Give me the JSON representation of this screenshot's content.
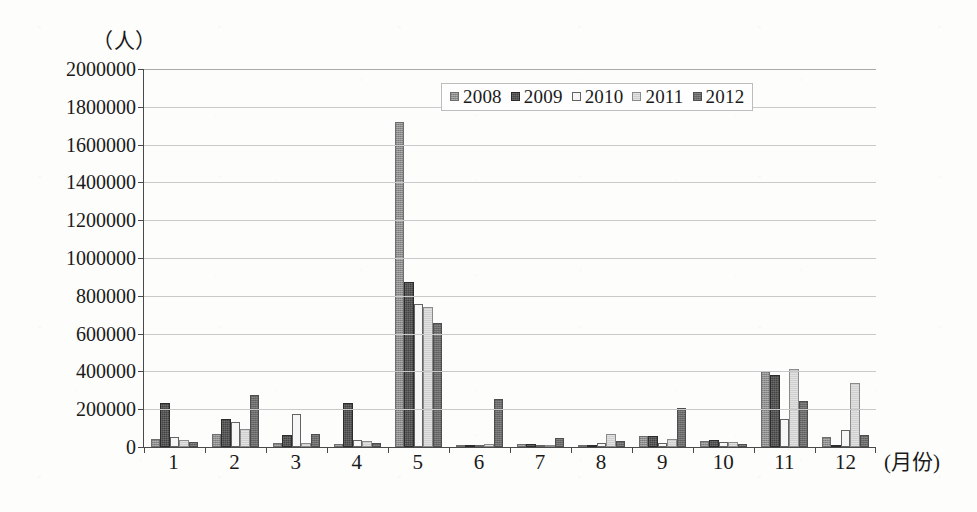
{
  "axis": {
    "unit_label": "（人）",
    "x_axis_title": "(月份)"
  },
  "legend": {
    "items": [
      {
        "label": "2008",
        "swatch": "legend-swatch-2008",
        "color": "#8d8d8d"
      },
      {
        "label": "2009",
        "swatch": "legend-swatch-2009",
        "color": "#434343"
      },
      {
        "label": "2010",
        "swatch": "legend-swatch-2010",
        "color": "#f6f6f6"
      },
      {
        "label": "2011",
        "swatch": "legend-swatch-2011",
        "color": "#cfcfcf"
      },
      {
        "label": "2012",
        "swatch": "legend-swatch-2012",
        "color": "#6a6a6a"
      }
    ]
  },
  "chart_data": {
    "type": "bar",
    "title": "",
    "subtitle": "",
    "xlabel": "(月份)",
    "ylabel": "（人）",
    "ylim": [
      0,
      2000000
    ],
    "ytick_step": 200000,
    "ytick_labels": [
      "2000000",
      "1800000",
      "1600000",
      "1400000",
      "1200000",
      "1000000",
      "800000",
      "600000",
      "400000",
      "200000",
      "0"
    ],
    "grid": true,
    "legend_position": "top-center",
    "categories": [
      "1",
      "2",
      "3",
      "4",
      "5",
      "6",
      "7",
      "8",
      "9",
      "10",
      "11",
      "12"
    ],
    "series": [
      {
        "name": "2008",
        "color": "#8d8d8d",
        "values": [
          45000,
          70000,
          20000,
          15000,
          1720000,
          5000,
          15000,
          10000,
          60000,
          30000,
          400000,
          55000
        ]
      },
      {
        "name": "2009",
        "color": "#434343",
        "values": [
          235000,
          150000,
          65000,
          235000,
          875000,
          8000,
          18000,
          12000,
          60000,
          35000,
          380000,
          10000
        ]
      },
      {
        "name": "2010",
        "color": "#f6f6f6",
        "values": [
          55000,
          130000,
          175000,
          35000,
          755000,
          10000,
          10000,
          20000,
          20000,
          25000,
          150000,
          90000
        ]
      },
      {
        "name": "2011",
        "color": "#cfcfcf",
        "values": [
          35000,
          95000,
          20000,
          30000,
          740000,
          18000,
          8000,
          70000,
          45000,
          25000,
          415000,
          340000
        ]
      },
      {
        "name": "2012",
        "color": "#6a6a6a",
        "values": [
          25000,
          275000,
          70000,
          20000,
          655000,
          255000,
          50000,
          30000,
          205000,
          15000,
          245000,
          65000
        ]
      }
    ]
  }
}
